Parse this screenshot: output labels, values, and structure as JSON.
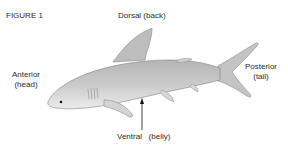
{
  "figure": {
    "title": "FIGURE 1",
    "labels": {
      "dorsal": "Dorsal (back)",
      "anterior_line1": "Anterior",
      "anterior_line2": "(head)",
      "posterior_line1": "Posterior",
      "posterior_line2": "(tail)",
      "ventral": "Ventral",
      "ventral_desc": "(belly)"
    },
    "colors": {
      "body": "#c9c9c9",
      "shade": "#a8a8a8",
      "belly": "#ececec",
      "outline": "#7a7a7a",
      "arrow": "#111111"
    }
  }
}
